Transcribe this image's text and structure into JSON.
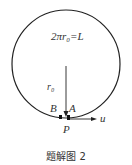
{
  "diagram": {
    "equation": "2πr₀=L",
    "radius_label": "r₀",
    "point_b": "B",
    "point_a": "A",
    "point_p": "P",
    "velocity_label": "u",
    "caption": "题解图 2"
  }
}
